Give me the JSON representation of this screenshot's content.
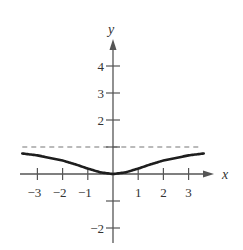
{
  "chart_data": {
    "type": "line",
    "title": "",
    "xlabel": "x",
    "ylabel": "y",
    "xlim": [
      -3.6,
      3.6
    ],
    "ylim": [
      -2.5,
      4.5
    ],
    "x_ticks": [
      -3,
      -2,
      -1,
      1,
      2,
      3
    ],
    "x_tick_labels": [
      "−3",
      "−2",
      "−1",
      "1",
      "2",
      "3"
    ],
    "y_ticks": [
      -2,
      -1,
      1,
      2,
      3,
      4
    ],
    "y_tick_labels": [
      "−2",
      "",
      "",
      "2",
      "3",
      "4"
    ],
    "grid": false,
    "legend": null,
    "series": [
      {
        "name": "f(x)",
        "style": "solid",
        "color": "#222222",
        "x": [
          -3.6,
          -3,
          -2,
          -1.5,
          -1,
          -0.5,
          0,
          0.5,
          1,
          1.5,
          2,
          3,
          3.6
        ],
        "y": [
          0.76,
          0.69,
          0.5,
          0.36,
          0.2,
          0.06,
          0,
          0.06,
          0.2,
          0.36,
          0.5,
          0.69,
          0.76
        ]
      },
      {
        "name": "horizontal asymptote y = 1",
        "style": "dashed",
        "color": "#666666",
        "x": [
          -3.6,
          3.5
        ],
        "y": [
          1,
          1
        ]
      }
    ]
  },
  "labels": {
    "x_axis": "x",
    "y_axis": "y"
  }
}
